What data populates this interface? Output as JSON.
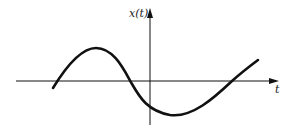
{
  "diagram": {
    "type": "signal-plot",
    "y_axis_label": "x(t)",
    "x_axis_label": "t",
    "colors": {
      "ink": "#111111",
      "background": "#ffffff"
    },
    "curve_description": "smooth sinusoid-like waveform: rises from below axis to a positive peak left of origin, crosses zero before origin, dips to a negative minimum just right of origin, then rises crossing zero and continuing upward"
  }
}
